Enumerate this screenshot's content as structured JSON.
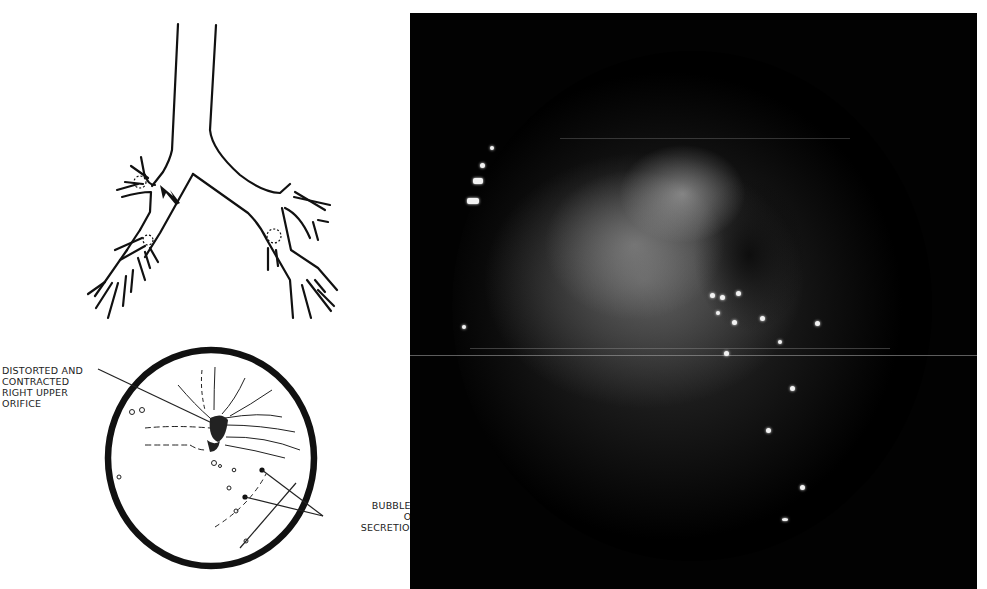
{
  "figure": {
    "diagram_labels": {
      "distorted_orifice": "Distorted and contracted right upper orifice",
      "bubbles": "Bubbles of secretion"
    },
    "panels": [
      {
        "name": "bronchial-tree-schematic",
        "description": "line drawing of trachea and bronchial tree with arrow at right upper lobe orifice"
      },
      {
        "name": "bronchoscopic-view-sketch",
        "description": "circular sketch of endoscopic view with labels"
      },
      {
        "name": "bronchoscopy-photograph",
        "description": "grayscale endoscopic photograph"
      }
    ],
    "colors": {
      "ink": "#111111",
      "photo_background": "#020202",
      "page": "#ffffff"
    }
  }
}
